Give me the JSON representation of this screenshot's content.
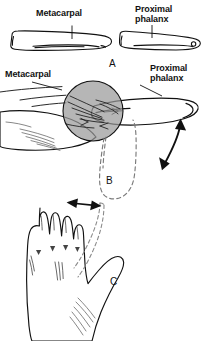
{
  "figure": {
    "background_color": "#ffffff",
    "ink_color": "#111111",
    "magnifier_fill": "#9a9a9a",
    "width": 211,
    "height": 341
  },
  "panel_a": {
    "letter": "A",
    "label_metacarpal": "Metacarpal",
    "label_proximal_phalanx": "Proximal\nphalanx",
    "caption_note": "Bone anatomy: metacarpal and proximal phalanx"
  },
  "panel_b": {
    "letter": "B",
    "label_metacarpal": "Metacarpal",
    "label_proximal_phalanx": "Proximal\nphalanx",
    "caption_note": "Lateral view of thumb with magnified MCP joint and flexion-extension arc"
  },
  "panel_c": {
    "letter": "C",
    "caption_note": "Dorsal view of hand showing thumb abduction range"
  }
}
